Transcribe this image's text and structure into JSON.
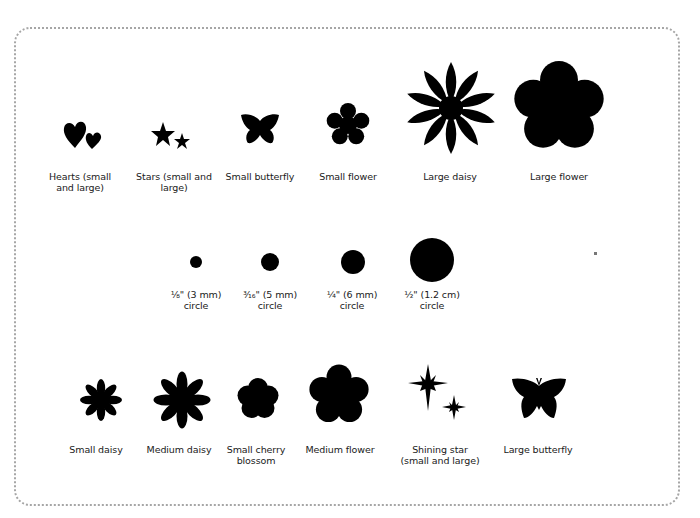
{
  "colors": {
    "shape": "#000000",
    "border": "#a6a6a6",
    "background": "#ffffff",
    "text": "#1a1a1a"
  },
  "rows": [
    {
      "items": [
        {
          "id": "hearts",
          "icon": "hearts-icon",
          "label": "Hearts (small\nand large)"
        },
        {
          "id": "stars",
          "icon": "stars-icon",
          "label": "Stars (small and\nlarge)"
        },
        {
          "id": "small-butterfly",
          "icon": "butterfly-icon",
          "label": "Small butterfly"
        },
        {
          "id": "small-flower",
          "icon": "flower-icon",
          "label": "Small flower"
        },
        {
          "id": "large-daisy",
          "icon": "daisy-icon",
          "label": "Large daisy"
        },
        {
          "id": "large-flower",
          "icon": "flower-icon",
          "label": "Large flower"
        }
      ]
    },
    {
      "items": [
        {
          "id": "circle-3mm",
          "icon": "circle-icon",
          "label": "⅛\" (3 mm)\ncircle"
        },
        {
          "id": "circle-5mm",
          "icon": "circle-icon",
          "label": "³⁄₁₆\" (5 mm)\ncircle"
        },
        {
          "id": "circle-6mm",
          "icon": "circle-icon",
          "label": "¼\" (6 mm)\ncircle"
        },
        {
          "id": "circle-12cm",
          "icon": "circle-icon",
          "label": "½\" (1.2 cm)\ncircle"
        }
      ]
    },
    {
      "items": [
        {
          "id": "small-daisy",
          "icon": "daisy-icon",
          "label": "Small daisy"
        },
        {
          "id": "medium-daisy",
          "icon": "daisy-icon",
          "label": "Medium daisy"
        },
        {
          "id": "small-cherry-blossom",
          "icon": "cherry-blossom-icon",
          "label": "Small cherry\nblossom"
        },
        {
          "id": "medium-flower",
          "icon": "flower-icon",
          "label": "Medium flower"
        },
        {
          "id": "shining-star",
          "icon": "shining-star-icon",
          "label": "Shining star\n(small and large)"
        },
        {
          "id": "large-butterfly",
          "icon": "butterfly-icon",
          "label": "Large butterfly"
        }
      ]
    }
  ]
}
